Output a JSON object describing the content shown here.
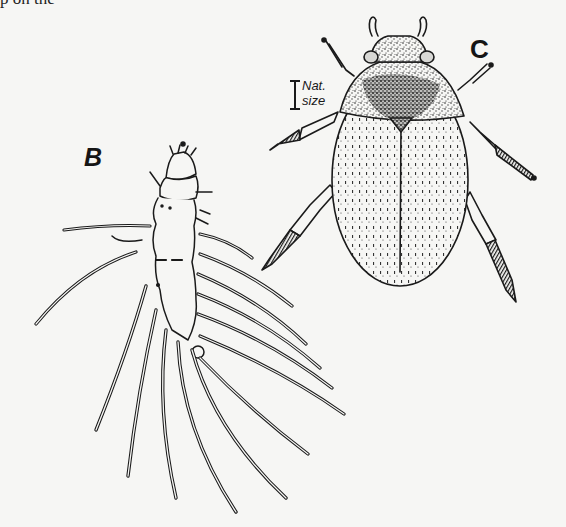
{
  "page": {
    "top_text_fragment": "p    on the",
    "background_color": "#f6f6f4",
    "ink_color": "#1a1a1a"
  },
  "figure": {
    "labels": {
      "larva": "B",
      "adult": "C"
    },
    "scale_marker": {
      "line1": "Nat.",
      "line2": "size"
    },
    "subjects": [
      {
        "id": "B",
        "description": "larva with long paired lateral filaments"
      },
      {
        "id": "C",
        "description": "adult beetle, dorsal view, stippled pronotum and striate elytra"
      }
    ]
  }
}
